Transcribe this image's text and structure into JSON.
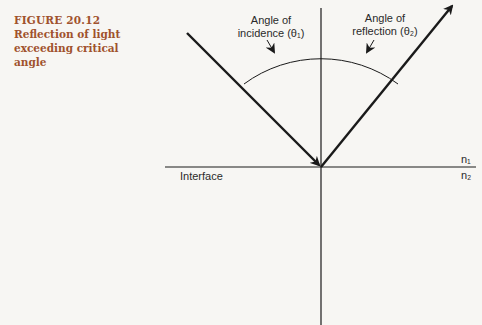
{
  "figure": {
    "number": "FIGURE 20.12",
    "title": "Reflection of light exceeding critical angle"
  },
  "labels": {
    "incidence_line1": "Angle of",
    "incidence_line2": "incidence (θ₁)",
    "reflection_line1": "Angle of",
    "reflection_line2": "reflection (θ₂)",
    "interface": "Interface",
    "n1": "n₁",
    "n2": "n₂"
  },
  "colors": {
    "caption": "#a0522d",
    "lines": "#1a1a1a"
  }
}
